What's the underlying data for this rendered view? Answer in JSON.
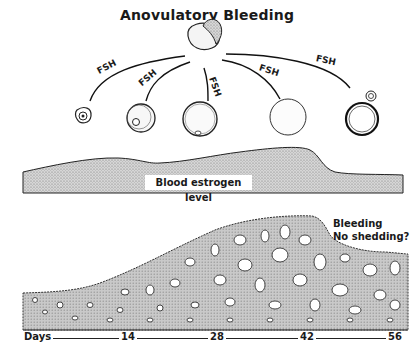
{
  "title": "Anovulatory Bleeding",
  "hormone": {
    "label": "FSH",
    "arrows": [
      {
        "label": "FSH",
        "target": "follicle-1"
      },
      {
        "label": "FSH",
        "target": "follicle-2"
      },
      {
        "label": "FSH",
        "target": "follicle-3"
      },
      {
        "label": "FSH",
        "target": "follicle-4"
      },
      {
        "label": "FSH",
        "target": "follicle-5"
      }
    ]
  },
  "labels": {
    "estrogen": "Blood estrogen level",
    "bleeding_line1": "Bleeding",
    "bleeding_line2": "No shedding?"
  },
  "axis": {
    "label": "Days",
    "ticks": [
      "14",
      "28",
      "42",
      "56"
    ]
  },
  "colors": {
    "ink": "#1a1a1a",
    "stipple": "#b8b8b8",
    "endometrium": "#c4c4c4",
    "background": "#ffffff"
  }
}
